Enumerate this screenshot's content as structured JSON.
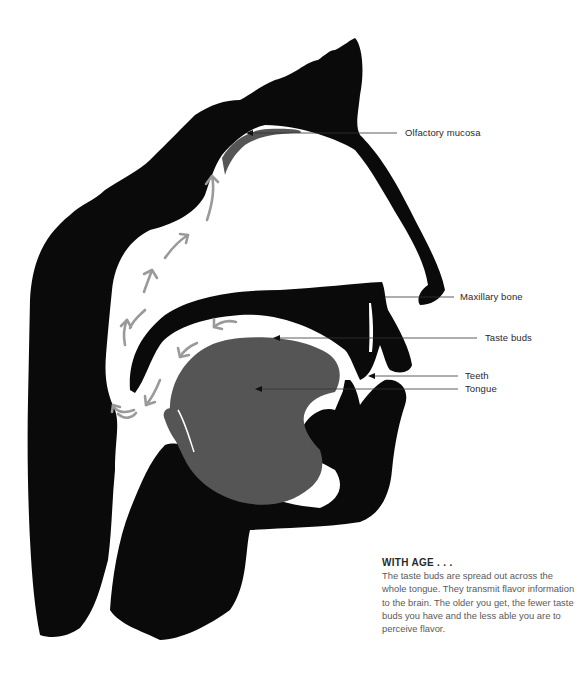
{
  "figure": {
    "colors": {
      "tissue": "#0a0a0a",
      "tongue": "#555555",
      "airflow_arrows": "#9a9a9a",
      "leader_lines": "#333333",
      "background": "#ffffff"
    },
    "labels": [
      {
        "id": "olfactory-mucosa",
        "text": "Olfactory mucosa"
      },
      {
        "id": "maxillary-bone",
        "text": "Maxillary bone"
      },
      {
        "id": "taste-buds",
        "text": "Taste buds"
      },
      {
        "id": "teeth",
        "text": "Teeth"
      },
      {
        "id": "tongue",
        "text": "Tongue"
      }
    ],
    "arrows": [
      {
        "name": "airflow-arrow",
        "direction": "up"
      },
      {
        "name": "airflow-arrow",
        "direction": "up"
      },
      {
        "name": "airflow-arrow",
        "direction": "up-right"
      },
      {
        "name": "airflow-arrow",
        "direction": "up-right"
      },
      {
        "name": "airflow-arrow",
        "direction": "up"
      },
      {
        "name": "airflow-arrow",
        "direction": "down-left"
      },
      {
        "name": "airflow-arrow",
        "direction": "down-left"
      },
      {
        "name": "airflow-arrow",
        "direction": "down-left"
      },
      {
        "name": "airflow-arrow",
        "direction": "curl-up"
      }
    ]
  },
  "caption": {
    "title": "WITH AGE . . .",
    "body": "The taste buds are spread out across the whole tongue. They transmit flavor information to the brain. The older you get, the fewer taste buds you have and the less able you are to perceive flavor."
  }
}
